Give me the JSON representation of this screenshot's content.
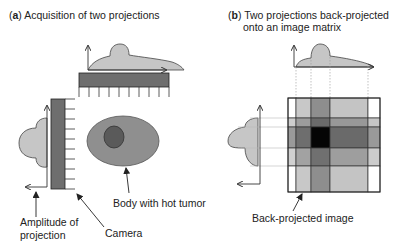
{
  "panel_a": {
    "letter": "a",
    "title": "Acquisition of two projections",
    "labels": {
      "amplitude_line1": "Amplitude of",
      "amplitude_line2": "projection",
      "camera": "Camera",
      "body": "Body with hot tumor"
    }
  },
  "panel_b": {
    "letter": "b",
    "title_line1": "Two projections back-projected",
    "title_line2": "onto an image matrix",
    "labels": {
      "image": "Back-projected image"
    },
    "grid": {
      "col_edges": [
        288,
        296,
        311,
        330,
        368,
        380
      ],
      "row_edges": [
        98,
        118,
        127,
        148,
        166,
        192
      ],
      "cells": [
        [
          "#ffffff",
          "#c8c8c8",
          "#8e8e8e",
          "#c4c4c4",
          "#ffffff"
        ],
        [
          "#cdcdcd",
          "#9c9c9c",
          "#6a6a6a",
          "#989898",
          "#c6c6c6"
        ],
        [
          "#9a9a9a",
          "#6e6e6e",
          "#050505",
          "#6a6a6a",
          "#999999"
        ],
        [
          "#d0d0d0",
          "#a2a2a2",
          "#707070",
          "#9e9e9e",
          "#cccccc"
        ],
        [
          "#ffffff",
          "#c8c8c8",
          "#8e8e8e",
          "#c4c4c4",
          "#ffffff"
        ]
      ]
    }
  },
  "colors": {
    "projection_fill": "#c6c6c6",
    "camera_fill": "#6e6e6e",
    "body_fill": "#8f8f8f",
    "tumor_fill": "#5a5a5a",
    "stroke": "#333333"
  }
}
